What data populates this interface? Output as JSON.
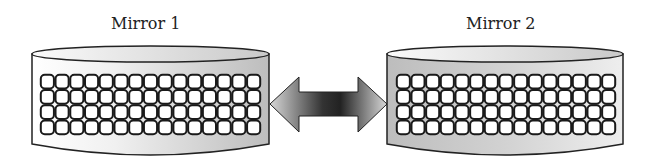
{
  "diagram": {
    "nodes": [
      {
        "id": "mirror1",
        "label": "Mirror 1",
        "grid": {
          "rows": 4,
          "cols": 15
        }
      },
      {
        "id": "mirror2",
        "label": "Mirror 2",
        "grid": {
          "rows": 4,
          "cols": 15
        }
      }
    ],
    "edges": [
      {
        "from": "mirror1",
        "to": "mirror2",
        "type": "bidirectional-arrow"
      }
    ]
  },
  "labels": {
    "mirror1": "Mirror 1",
    "mirror2": "Mirror 2"
  }
}
